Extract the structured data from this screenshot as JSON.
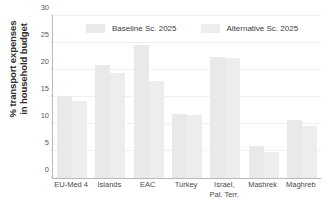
{
  "chart_data": {
    "type": "bar",
    "title": "",
    "subtitle": "",
    "xlabel": "",
    "ylabel": "% transport expenses\nin household budget",
    "ylim": [
      0,
      30
    ],
    "yticks": [
      0,
      5,
      10,
      15,
      20,
      25,
      30
    ],
    "ytick_labels": [
      "0",
      "5",
      "10",
      "15",
      "20",
      "25",
      "30"
    ],
    "grid": true,
    "grid_axis": "y",
    "legend_position": "top",
    "categories": [
      "EU-Med 4",
      "Islands",
      "EAC",
      "Turkey",
      "Israel,\nPal. Terr.",
      "Mashrek",
      "Maghreb"
    ],
    "series": [
      {
        "name": "Baseline Sc. 2025",
        "color": "#e9e9e9",
        "values": [
          15.1,
          21.0,
          24.6,
          11.8,
          22.4,
          6.0,
          10.7
        ]
      },
      {
        "name": "Alternative Sc. 2025",
        "color": "#ededed",
        "values": [
          14.2,
          19.5,
          18.0,
          11.7,
          22.2,
          4.9,
          9.6
        ]
      }
    ]
  },
  "axis": {
    "line_color": "#b9b9b9",
    "grid_color": "#f0f0f0"
  }
}
